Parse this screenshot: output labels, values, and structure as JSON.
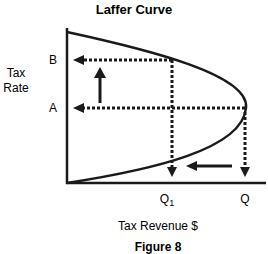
{
  "title": "Laffer Curve",
  "caption": "Figure 8",
  "y_axis": {
    "label_line1": "Tax",
    "label_line2": "Rate",
    "ticks": [
      "B",
      "A"
    ]
  },
  "x_axis": {
    "label": "Tax Revenue $",
    "ticks": [
      {
        "main": "Q",
        "sub": "1"
      },
      {
        "main": "Q",
        "sub": ""
      }
    ]
  },
  "annotations": [
    {
      "name": "rate-increase-arrow",
      "from": "A",
      "to": "B",
      "direction": "up"
    },
    {
      "name": "revenue-decrease-arrow",
      "from": "Q",
      "to": "Q1",
      "direction": "left"
    }
  ],
  "colors": {
    "ink": "#1a1a1a",
    "background": "#ffffff"
  }
}
